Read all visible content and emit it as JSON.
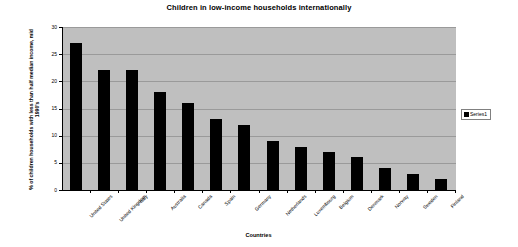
{
  "chart_data": {
    "type": "bar",
    "title": "Children in low-income households internationally",
    "xlabel": "Countries",
    "ylabel": "% of children households with less than half median income, mid 1990's",
    "categories": [
      "United States",
      "United Kingdom",
      "Italy",
      "Australia",
      "Canada",
      "Spain",
      "Germany",
      "Netherlands",
      "Luxembourg",
      "Belgium",
      "Denmark",
      "Norway",
      "Sweden",
      "Finland"
    ],
    "values": [
      27,
      22,
      22,
      18,
      16,
      13,
      12,
      9,
      8,
      7,
      6,
      4,
      3,
      2
    ],
    "series": [
      {
        "name": "Series1",
        "values": [
          27,
          22,
          22,
          18,
          16,
          13,
          12,
          9,
          8,
          7,
          6,
          4,
          3,
          2
        ]
      }
    ],
    "ylim": [
      0,
      30
    ],
    "ytick_step": 5,
    "yticks": [
      0,
      5,
      10,
      15,
      20,
      25,
      30
    ],
    "grid": true,
    "legend": {
      "position": "right",
      "entries": [
        "Series1"
      ]
    },
    "colors": {
      "bar": "#000000",
      "plot_background": "#bfbfbf",
      "chart_background": "#ffffff",
      "gridline": "#9a9a9a",
      "axis": "#000000",
      "text": "#000000"
    }
  }
}
